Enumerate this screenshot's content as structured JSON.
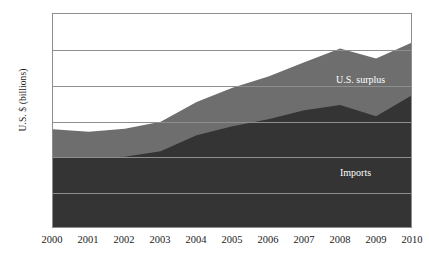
{
  "chart_data": {
    "type": "area",
    "stacked": true,
    "title": "",
    "xlabel": "",
    "ylabel": "U.S. $ (billions)",
    "grid": true,
    "legend_position": "inline-annotations",
    "ylim": [
      0,
      600
    ],
    "ytick_labels": [
      "600",
      "500",
      "400",
      "300",
      "200",
      "100",
      "0"
    ],
    "yticks": [
      600,
      500,
      400,
      300,
      200,
      100,
      0
    ],
    "categories": [
      "2000",
      "2001",
      "2002",
      "2003",
      "2004",
      "2005",
      "2006",
      "2007",
      "2008",
      "2009",
      "2010"
    ],
    "x": [
      2000,
      2001,
      2002,
      2003,
      2004,
      2005,
      2006,
      2007,
      2008,
      2009,
      2010
    ],
    "series": [
      {
        "name": "Imports",
        "color": "#343434",
        "values": [
          198,
          196,
          200,
          215,
          260,
          285,
          305,
          330,
          345,
          313,
          372
        ]
      },
      {
        "name": "U.S. surplus",
        "color": "#6e6e6e",
        "values": [
          79,
          74,
          78,
          83,
          93,
          108,
          120,
          135,
          158,
          162,
          148
        ]
      }
    ],
    "totals": [
      277,
      270,
      278,
      298,
      353,
      393,
      425,
      465,
      503,
      475,
      520
    ],
    "annotations": [
      {
        "text": "U.S. surplus",
        "series": "U.S. surplus"
      },
      {
        "text": "Imports",
        "series": "Imports"
      }
    ]
  },
  "axes": {
    "y_title": "U.S. $ (billions)"
  }
}
